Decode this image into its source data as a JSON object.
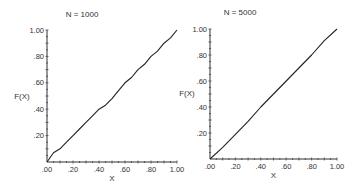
{
  "chart_data": [
    {
      "type": "line",
      "title": "N = 1000",
      "xlabel": "X",
      "ylabel": "F(X)",
      "xlim": [
        0,
        1
      ],
      "ylim": [
        0,
        1
      ],
      "x_ticks": [
        ".00",
        ".20",
        ".40",
        ".60",
        ".80",
        "1.00"
      ],
      "y_ticks": [
        ".20",
        ".40",
        ".60",
        ".80",
        "1.00"
      ],
      "grid": false,
      "series": [
        {
          "name": "F(X)",
          "x": [
            0.0,
            0.05,
            0.1,
            0.15,
            0.2,
            0.25,
            0.3,
            0.35,
            0.4,
            0.45,
            0.5,
            0.55,
            0.6,
            0.65,
            0.7,
            0.75,
            0.8,
            0.85,
            0.9,
            0.95,
            1.0
          ],
          "values": [
            0.0,
            0.07,
            0.1,
            0.15,
            0.2,
            0.25,
            0.3,
            0.35,
            0.4,
            0.43,
            0.48,
            0.54,
            0.6,
            0.64,
            0.7,
            0.74,
            0.8,
            0.84,
            0.9,
            0.94,
            1.0
          ]
        }
      ]
    },
    {
      "type": "line",
      "title": "N = 5000",
      "xlabel": "X",
      "ylabel": "F(X)",
      "xlim": [
        0,
        1
      ],
      "ylim": [
        0,
        1
      ],
      "x_ticks": [
        ".00",
        ".20",
        ".40",
        ".60",
        ".80",
        "1.00"
      ],
      "y_ticks": [
        ".20",
        ".40",
        ".60",
        ".80",
        "1.00"
      ],
      "grid": false,
      "series": [
        {
          "name": "F(X)",
          "x": [
            0.0,
            0.1,
            0.2,
            0.3,
            0.4,
            0.5,
            0.6,
            0.7,
            0.8,
            0.9,
            1.0
          ],
          "values": [
            0.0,
            0.09,
            0.19,
            0.29,
            0.4,
            0.5,
            0.6,
            0.7,
            0.8,
            0.91,
            1.0
          ]
        }
      ]
    }
  ]
}
